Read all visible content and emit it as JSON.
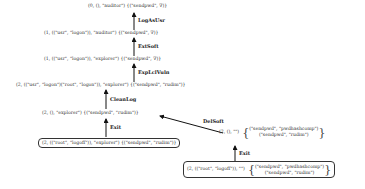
{
  "diagram": {
    "nodes": [
      {
        "id": "n0",
        "text": "(0, (), \"auditor\") {(\"sendpwd\", ∇)}"
      },
      {
        "id": "n1",
        "text": "(1, ((\"usr\", \"logon\")), \"auditor\") {(\"sendpwd\", ∇)}"
      },
      {
        "id": "n2",
        "text": "(1, ((\"usr\", \"logon\")), \"explorer\") {(\"sendpwd\", ∇)}"
      },
      {
        "id": "n3",
        "text": "(2, ((\"usr\", \"logon\")(\"root\", \"logon\")), \"explorer\") {(\"sendpwd\", \"rudim\")}"
      },
      {
        "id": "n4",
        "text": "(2, (), \"explorer\") {(\"sendpwd\", \"rudim\")}"
      },
      {
        "id": "n5",
        "text": "(2, ((\"root\", \"logoff\")), \"explorer\") {(\"sendpwd\", \"rudim\")}"
      },
      {
        "id": "n6",
        "prefix": "(2, (), \"\")",
        "set_lines": [
          "(\"sendpwd\", \"pwdhashcomp\")",
          "(\"sendpwd\", \"rudim\")"
        ]
      },
      {
        "id": "n7",
        "prefix": "(2, ((\"root\", \"logoff\")), \"\")",
        "set_lines": [
          "(\"sendpwd\", \"pwdhashcomp\")",
          "(\"sendpwd\", \"rudim\")"
        ]
      }
    ],
    "edges": [
      {
        "from": "n1",
        "to": "n0",
        "label": "LogAsUsr"
      },
      {
        "from": "n2",
        "to": "n1",
        "label": "ExtSoft"
      },
      {
        "from": "n3",
        "to": "n2",
        "label": "ExpLclVuln"
      },
      {
        "from": "n4",
        "to": "n3",
        "label": "CleanLog"
      },
      {
        "from": "n5",
        "to": "n4",
        "label": "Exit"
      },
      {
        "from": "n6",
        "to": "n4",
        "label": "DelSoft"
      },
      {
        "from": "n7",
        "to": "n6",
        "label": "Exit"
      }
    ],
    "brace_open": "{",
    "brace_close": "}"
  }
}
